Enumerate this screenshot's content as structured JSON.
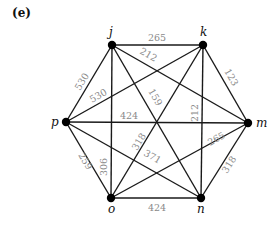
{
  "panel_label": "(e)",
  "nodes": [
    {
      "id": "j",
      "label": "j",
      "x": 112,
      "y": 45
    },
    {
      "id": "k",
      "label": "k",
      "x": 203,
      "y": 45
    },
    {
      "id": "m",
      "label": "m",
      "x": 248,
      "y": 123
    },
    {
      "id": "n",
      "label": "n",
      "x": 201,
      "y": 198
    },
    {
      "id": "o",
      "label": "o",
      "x": 111,
      "y": 198
    },
    {
      "id": "p",
      "label": "p",
      "x": 66,
      "y": 122
    }
  ],
  "edges": [
    {
      "from": "j",
      "to": "k",
      "weight": "265"
    },
    {
      "from": "j",
      "to": "m",
      "weight": "212"
    },
    {
      "from": "j",
      "to": "n",
      "weight": "159"
    },
    {
      "from": "j",
      "to": "o",
      "weight": "306"
    },
    {
      "from": "j",
      "to": "p",
      "weight": "530"
    },
    {
      "from": "k",
      "to": "p",
      "weight": "530"
    },
    {
      "from": "k",
      "to": "m",
      "weight": "123"
    },
    {
      "from": "k",
      "to": "n",
      "weight": "212"
    },
    {
      "from": "k",
      "to": "o",
      "weight": "318"
    },
    {
      "from": "p",
      "to": "m",
      "weight": "424"
    },
    {
      "from": "p",
      "to": "n",
      "weight": "371"
    },
    {
      "from": "p",
      "to": "o",
      "weight": "259"
    },
    {
      "from": "m",
      "to": "o",
      "weight": "265"
    },
    {
      "from": "m",
      "to": "n",
      "weight": "318"
    },
    {
      "from": "o",
      "to": "n",
      "weight": "424"
    }
  ]
}
